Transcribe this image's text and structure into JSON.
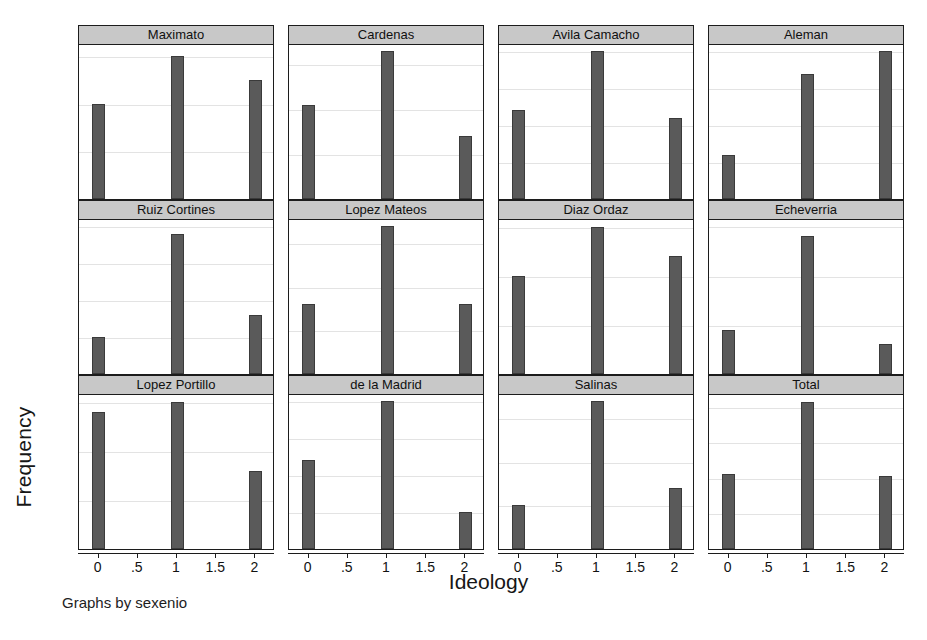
{
  "figure": {
    "xlabel": "Ideology",
    "ylabel": "Frequency",
    "note": "Graphs by sexenio",
    "bar_color": "#5a5a5a",
    "title_band_color": "#c8c8c8",
    "background": "#ffffff",
    "gridline_color": "#e3e3e3"
  },
  "chart_data": {
    "type": "bar",
    "title": "",
    "xlabel": "Ideology",
    "ylabel": "Frequency",
    "note": "Graphs by sexenio",
    "categories": [
      0,
      1,
      2
    ],
    "xticks": [
      "0",
      ".5",
      "1",
      "1.5",
      "2"
    ],
    "xtick_values": [
      0,
      0.5,
      1,
      1.5,
      2
    ],
    "xlim": [
      -0.25,
      2.25
    ],
    "grid": true,
    "legend": "none",
    "layout": {
      "rows": 3,
      "cols": 4
    },
    "panels": [
      {
        "title": "Maximato",
        "values": [
          4,
          6,
          5
        ],
        "yticks": [
          0,
          2,
          4,
          6
        ],
        "ytick_labels": [
          "0",
          "2",
          "4",
          "6"
        ],
        "ylim": [
          0,
          6.5
        ]
      },
      {
        "title": "Cardenas",
        "values": [
          21,
          33,
          14
        ],
        "yticks": [
          0,
          10,
          20,
          30
        ],
        "ytick_labels": [
          "0",
          "10",
          "20",
          "30"
        ],
        "ylim": [
          0,
          34.5
        ]
      },
      {
        "title": "Avila Camacho",
        "values": [
          12,
          20,
          11
        ],
        "yticks": [
          0,
          5,
          10,
          15,
          20
        ],
        "ytick_labels": [
          "0",
          "5",
          "10",
          "15",
          "20"
        ],
        "ylim": [
          0,
          21
        ]
      },
      {
        "title": "Aleman",
        "values": [
          6,
          17,
          20
        ],
        "yticks": [
          0,
          5,
          10,
          15,
          20
        ],
        "ytick_labels": [
          "0",
          "5",
          "10",
          "15",
          "20"
        ],
        "ylim": [
          0,
          21
        ]
      },
      {
        "title": "Ruiz Cortines",
        "values": [
          5,
          19,
          8
        ],
        "yticks": [
          0,
          5,
          10,
          15,
          20
        ],
        "ytick_labels": [
          "0",
          "5",
          "10",
          "15",
          "20"
        ],
        "ylim": [
          0,
          21
        ]
      },
      {
        "title": "Lopez Mateos",
        "values": [
          8,
          17,
          8
        ],
        "yticks": [
          0,
          5,
          10,
          15
        ],
        "ytick_labels": [
          "0",
          "5",
          "10",
          "15"
        ],
        "ylim": [
          0,
          17.8
        ]
      },
      {
        "title": "Diaz Ordaz",
        "values": [
          10,
          15,
          12
        ],
        "yticks": [
          0,
          5,
          10,
          15
        ],
        "ytick_labels": [
          "0",
          "5",
          "10",
          "15"
        ],
        "ylim": [
          0,
          15.8
        ]
      },
      {
        "title": "Echeverria",
        "values": [
          9,
          28,
          6
        ],
        "yticks": [
          0,
          10,
          20,
          30
        ],
        "ytick_labels": [
          "0",
          "10",
          "20",
          "30"
        ],
        "ylim": [
          0,
          31.5
        ]
      },
      {
        "title": "Lopez Portillo",
        "values": [
          14,
          15,
          8
        ],
        "yticks": [
          0,
          5,
          10,
          15
        ],
        "ytick_labels": [
          "0",
          "5",
          "10",
          "15"
        ],
        "ylim": [
          0,
          15.8
        ]
      },
      {
        "title": "de la Madrid",
        "values": [
          12,
          20,
          5
        ],
        "yticks": [
          0,
          5,
          10,
          15,
          20
        ],
        "ytick_labels": [
          "0",
          "5",
          "10",
          "15",
          "20"
        ],
        "ylim": [
          0,
          21
        ]
      },
      {
        "title": "Salinas",
        "values": [
          5,
          17,
          7
        ],
        "yticks": [
          0,
          5,
          10,
          15
        ],
        "ytick_labels": [
          "0",
          "5",
          "10",
          "15"
        ],
        "ylim": [
          0,
          17.8
        ]
      },
      {
        "title": "Total",
        "values": [
          105,
          207,
          103
        ],
        "yticks": [
          0,
          50,
          100,
          150,
          200
        ],
        "ytick_labels": [
          "0",
          "50",
          "100",
          "150",
          "200"
        ],
        "ylim": [
          0,
          218
        ]
      }
    ]
  }
}
